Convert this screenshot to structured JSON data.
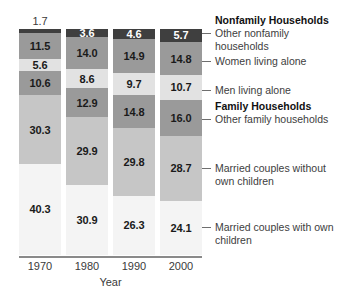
{
  "chart_data": {
    "type": "bar",
    "subtype": "stacked-100-percent",
    "title": "",
    "xlabel": "Year",
    "ylabel": "",
    "ylim": [
      0,
      100
    ],
    "grid": false,
    "legend_position": "right-inline-annotations",
    "categories": [
      "1970",
      "1980",
      "1990",
      "2000"
    ],
    "series": [
      {
        "name": "Other nonfamily households",
        "group": "Nonfamily Households",
        "color": "#3f3f3f",
        "text_color": "#ffffff",
        "values": [
          1.7,
          3.6,
          4.6,
          5.7
        ]
      },
      {
        "name": "Women living alone",
        "group": "Nonfamily Households",
        "color": "#9a9a9a",
        "text_color": "#1a1a1a",
        "values": [
          11.5,
          14.0,
          14.9,
          14.8
        ]
      },
      {
        "name": "Men living alone",
        "group": "Nonfamily Households",
        "color": "#e2e2e2",
        "text_color": "#1a1a1a",
        "values": [
          5.6,
          8.6,
          9.7,
          10.7
        ]
      },
      {
        "name": "Other family households",
        "group": "Family Households",
        "color": "#9a9a9a",
        "text_color": "#1a1a1a",
        "values": [
          10.6,
          12.9,
          14.8,
          16.0
        ]
      },
      {
        "name": "Married couples without own children",
        "group": "Family Households",
        "color": "#c6c6c6",
        "text_color": "#1a1a1a",
        "values": [
          30.3,
          29.9,
          29.8,
          28.7
        ]
      },
      {
        "name": "Married couples with own children",
        "group": "Family Households",
        "color": "#f4f4f4",
        "text_color": "#1a1a1a",
        "values": [
          40.3,
          30.9,
          26.3,
          24.1
        ]
      }
    ]
  },
  "axis": {
    "title": "Year",
    "ticks": [
      "1970",
      "1980",
      "1990",
      "2000"
    ]
  },
  "annotations": {
    "group_nonfamily": "Nonfamily Households",
    "group_family": "Family Households",
    "items": [
      {
        "label": "Other nonfamily households"
      },
      {
        "label": "Women living alone"
      },
      {
        "label": "Men living alone"
      },
      {
        "label": "Other family households"
      },
      {
        "label": "Married couples without own children"
      },
      {
        "label": "Married couples with own children"
      }
    ]
  }
}
